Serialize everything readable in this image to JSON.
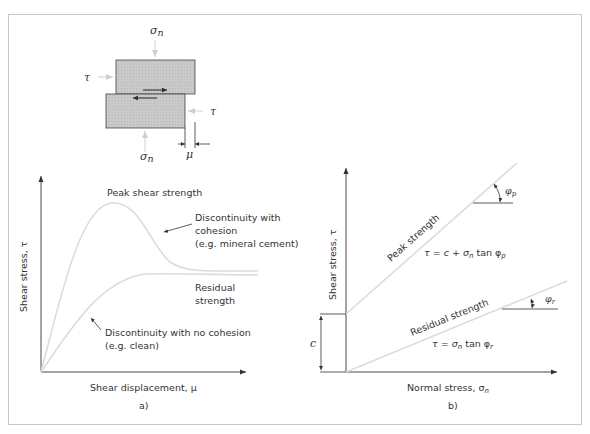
{
  "figure": {
    "specimen": {
      "labels": {
        "sigma_top": "σ",
        "sigma_top_sub": "n",
        "sigma_bottom": "σ",
        "sigma_bottom_sub": "n",
        "tau_left": "τ",
        "tau_right": "τ",
        "mu": "μ"
      }
    },
    "panel_a": {
      "caption": "a)",
      "y_axis_label": "Shear stress, τ",
      "x_axis_label": "Shear displacement, μ",
      "peak_label": "Peak shear strength",
      "cohesion_note": [
        "Discontinuity with",
        "cohesion",
        "(e.g. mineral cement)"
      ],
      "residual_label": [
        "Residual",
        "strength"
      ],
      "no_cohesion_note": [
        "Discontinuity with no cohesion",
        "(e.g. clean)"
      ]
    },
    "panel_b": {
      "caption": "b)",
      "y_axis_label": "Shear stress, τ",
      "x_axis_label": "Normal stress, σ",
      "x_axis_sub": "n",
      "peak_line_label": "Peak strength",
      "peak_equation": "τ = c + σ",
      "peak_equation_tail": " tan φ",
      "peak_equation_sub": "n",
      "peak_equation_phi_sub": "p",
      "residual_line_label": "Residual strength",
      "residual_equation": "τ = σ",
      "residual_equation_sub": "n",
      "residual_equation_tail": " tan φ",
      "residual_equation_phi_sub": "r",
      "cohesion_label": "c",
      "phi_p": "φ",
      "phi_p_sub": "p",
      "phi_r": "φ",
      "phi_r_sub": "r"
    },
    "colors": {
      "border": "#c8c8c8",
      "axis": "#333333",
      "curve": "#dcdcdc",
      "block_fill": "#c9c9c9"
    }
  }
}
